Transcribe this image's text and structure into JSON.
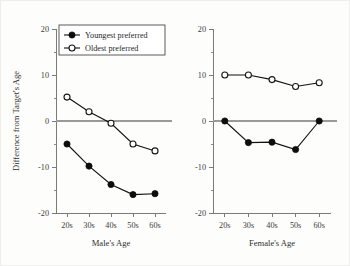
{
  "chart_data": {
    "type": "line",
    "title": "",
    "panels": [
      {
        "id": "male",
        "xlabel": "Male's Age",
        "ylabel": "Difference from Target's Age",
        "categories": [
          "20s",
          "30s",
          "40s",
          "50s",
          "60s"
        ],
        "ylim": [
          -20,
          20
        ],
        "yticks": [
          20,
          10,
          0,
          -10,
          -20
        ],
        "yticklabels": [
          "20",
          "10",
          "0",
          "-10",
          "-20"
        ],
        "yminorticks": [
          15,
          5,
          -5,
          -15
        ],
        "grid": false,
        "zero_reference_line": true,
        "series": [
          {
            "name": "Youngest preferred",
            "marker": "filled-circle",
            "values": [
              -5.0,
              -9.8,
              -13.8,
              -16.0,
              -15.8
            ]
          },
          {
            "name": "Oldest preferred",
            "marker": "open-circle",
            "values": [
              5.2,
              2.0,
              -0.5,
              -5.0,
              -6.5
            ]
          }
        ]
      },
      {
        "id": "female",
        "xlabel": "Female's Age",
        "ylabel": "",
        "categories": [
          "20s",
          "30s",
          "40s",
          "50s",
          "60s"
        ],
        "ylim": [
          -20,
          20
        ],
        "yticks": [
          20,
          10,
          0,
          -10,
          -20
        ],
        "yticklabels": [
          "20",
          "10",
          "0",
          "-10",
          "-20"
        ],
        "yminorticks": [
          15,
          5,
          -5,
          -15
        ],
        "grid": false,
        "zero_reference_line": true,
        "series": [
          {
            "name": "Youngest preferred",
            "marker": "filled-circle",
            "values": [
              0.0,
              -4.7,
              -4.6,
              -6.2,
              0.0
            ]
          },
          {
            "name": "Oldest preferred",
            "marker": "open-circle",
            "values": [
              10.0,
              10.0,
              9.0,
              7.5,
              8.3
            ]
          }
        ]
      }
    ],
    "legend": {
      "position": "upper-left-inside-panel-1",
      "entries": [
        {
          "label": "Youngest preferred",
          "marker": "filled-circle"
        },
        {
          "label": "Oldest preferred",
          "marker": "open-circle"
        }
      ]
    }
  },
  "colors": {
    "background": "#fdfdfb",
    "axis": "#7a7a7a",
    "series": "#111111",
    "zero_line": "#9a9a9a",
    "open_marker_fill": "#ffffff"
  }
}
